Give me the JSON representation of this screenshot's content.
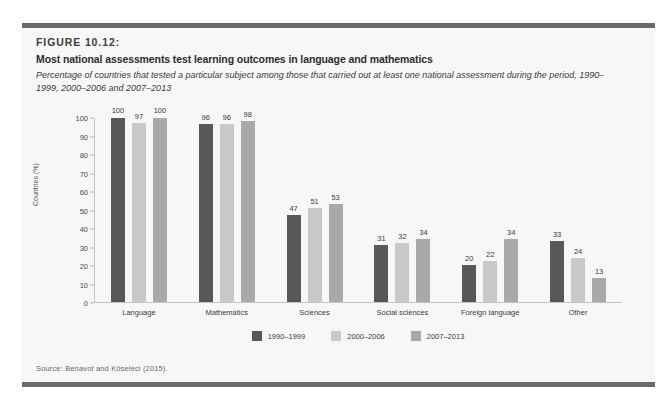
{
  "figure": {
    "number": "FIGURE 10.12:",
    "title": "Most national assessments test learning outcomes in language and mathematics",
    "subtitle": "Percentage of countries that tested a particular subject among those that carried out at least one national assessment during the period, 1990–1999, 2000–2006 and 2007–2013",
    "source": "Source: Benavot and Köseleci (2015)."
  },
  "colors": {
    "series_1990_1999": "#58585a",
    "series_2000_2006": "#c9c9c9",
    "series_2007_2013": "#a9a9ab",
    "panel_background": "#f7f7f8",
    "rule": "#6b6b6d",
    "axis": "#c3c3c5",
    "text": "#3a3a3c"
  },
  "chart_data": {
    "type": "bar",
    "title": "Most national assessments test learning outcomes in language and mathematics",
    "subtitle": "Percentage of countries that tested a particular subject among those that carried out at least one national assessment during the period, 1990–1999, 2000–2006 and 2007–2013",
    "xlabel": "",
    "ylabel": "Countries (%)",
    "ylim": [
      0,
      100
    ],
    "yticks": [
      0,
      10,
      20,
      30,
      40,
      50,
      60,
      70,
      80,
      90,
      100
    ],
    "grid": false,
    "legend_position": "bottom-center",
    "categories": [
      "Language",
      "Mathematics",
      "Sciences",
      "Social sciences",
      "Foreign language",
      "Other"
    ],
    "series": [
      {
        "name": "1990–1999",
        "color": "#58585a",
        "values": [
          100,
          96,
          47,
          31,
          20,
          33
        ]
      },
      {
        "name": "2000–2006",
        "color": "#c9c9c9",
        "values": [
          97,
          96,
          51,
          32,
          22,
          24
        ]
      },
      {
        "name": "2007–2013",
        "color": "#a9a9ab",
        "values": [
          100,
          98,
          53,
          34,
          34,
          13
        ]
      }
    ]
  }
}
